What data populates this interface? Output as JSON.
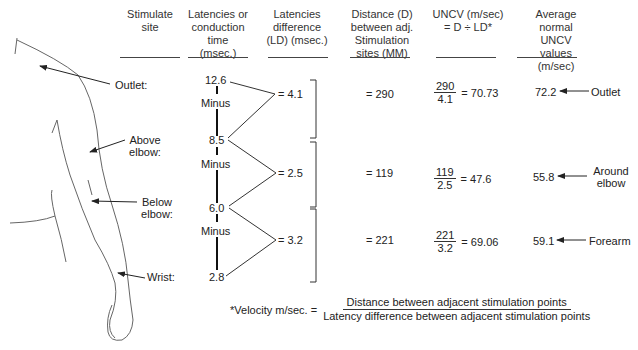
{
  "headers": {
    "site": "Stimulate site",
    "latency": "Latencies or conduction time (msec.)",
    "ld": "Latencies difference (LD) (msec.)",
    "distance": "Distance (D) between adj. Stimulation sites (MM)",
    "uncv": "UNCV (m/sec) = D ÷ LD*",
    "avg": "Average normal UNCV values (m/sec)"
  },
  "sites": [
    {
      "label": "Outlet:"
    },
    {
      "label": "Above elbow:"
    },
    {
      "label": "Below elbow:"
    },
    {
      "label": "Wrist:"
    }
  ],
  "latencies": [
    "12.6",
    "8.5",
    "6.0",
    "2.8"
  ],
  "minus_label": "Minus",
  "segments": [
    {
      "ld": "= 4.1",
      "distance": "= 290",
      "num": "290",
      "den": "4.1",
      "uncv": "= 70.73",
      "avg": "72.2",
      "region": "Outlet"
    },
    {
      "ld": "= 2.5",
      "distance": "= 119",
      "num": "119",
      "den": "2.5",
      "uncv": "= 47.6",
      "avg": "55.8",
      "region": "Around elbow"
    },
    {
      "ld": "= 3.2",
      "distance": "= 221",
      "num": "221",
      "den": "3.2",
      "uncv": "= 69.06",
      "avg": "59.1",
      "region": "Forearm"
    }
  ],
  "footnote": {
    "lhs": "*Velocity m/sec. =",
    "numerator": "Distance between adjacent stimulation points",
    "denominator": "Latency difference between adjacent stimulation points"
  }
}
